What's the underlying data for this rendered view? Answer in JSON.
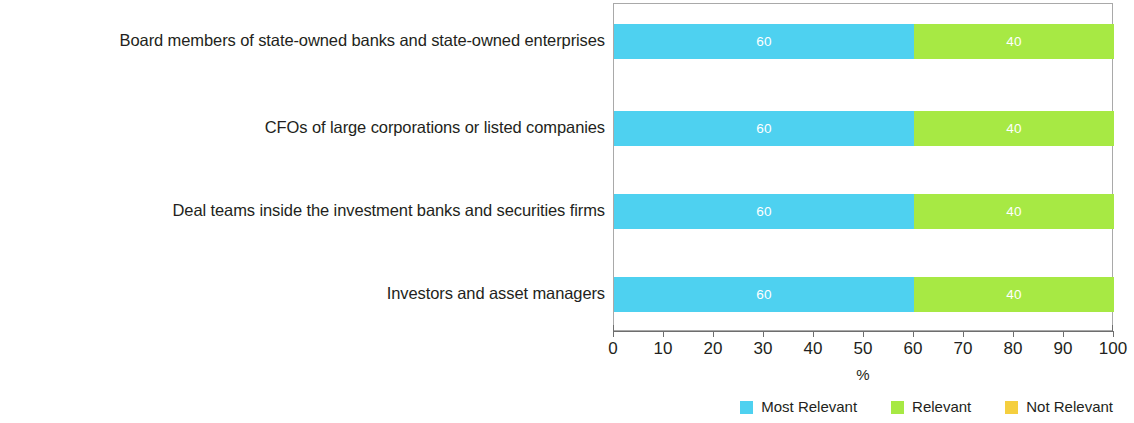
{
  "chart_data": {
    "type": "bar",
    "orientation": "horizontal",
    "stacked": true,
    "title": "",
    "subtitle": "",
    "xlabel": "%",
    "ylabel": "",
    "xlim": [
      0,
      100
    ],
    "xticks": [
      0,
      10,
      20,
      30,
      40,
      50,
      60,
      70,
      80,
      90,
      100
    ],
    "xtick_labels": [
      "0",
      "10",
      "20",
      "30",
      "40",
      "50",
      "60",
      "70",
      "80",
      "90",
      "100"
    ],
    "grid": false,
    "legend_position": "bottom-right",
    "categories": [
      "Board members of state-owned banks and state-owned enterprises",
      "CFOs of large corporations or listed companies",
      "Deal teams inside the investment banks and securities firms",
      "Investors and asset managers"
    ],
    "series": [
      {
        "name": "Most Relevant",
        "color": "#4ed1f0",
        "values": [
          60,
          60,
          60,
          60
        ],
        "value_labels": [
          "60",
          "60",
          "60",
          "60"
        ]
      },
      {
        "name": "Relevant",
        "color": "#a7e944",
        "values": [
          40,
          40,
          40,
          40
        ],
        "value_labels": [
          "40",
          "40",
          "40",
          "40"
        ]
      },
      {
        "name": "Not Relevant",
        "color": "#f5cf3f",
        "values": [
          0,
          0,
          0,
          0
        ],
        "value_labels": [
          "",
          "",
          "",
          ""
        ]
      }
    ]
  },
  "axis": {
    "x_title": "%",
    "tick_labels": [
      "0",
      "10",
      "20",
      "30",
      "40",
      "50",
      "60",
      "70",
      "80",
      "90",
      "100"
    ]
  },
  "legend": {
    "items": [
      {
        "label": "Most Relevant",
        "color": "#4ed1f0"
      },
      {
        "label": "Relevant",
        "color": "#a7e944"
      },
      {
        "label": "Not Relevant",
        "color": "#f5cf3f"
      }
    ]
  },
  "colors": {
    "most_relevant": "#4ed1f0",
    "relevant": "#a7e944",
    "not_relevant": "#f5cf3f",
    "frame": "#a9a9a9",
    "axis": "#6e6e6e",
    "text": "#231f20",
    "value_label_text": "#ffffff"
  }
}
